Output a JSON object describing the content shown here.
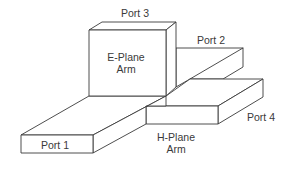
{
  "diagram": {
    "type": "magic-tee-waveguide",
    "labels": {
      "port1": "Port 1",
      "port2": "Port 2",
      "port3": "Port 3",
      "port4": "Port 4",
      "e_plane_line1": "E-Plane",
      "e_plane_line2": "Arm",
      "h_plane_line1": "H-Plane",
      "h_plane_line2": "Arm"
    },
    "colors": {
      "line": "#3a3a3a",
      "text": "#3a3a3a",
      "background": "#ffffff"
    }
  }
}
